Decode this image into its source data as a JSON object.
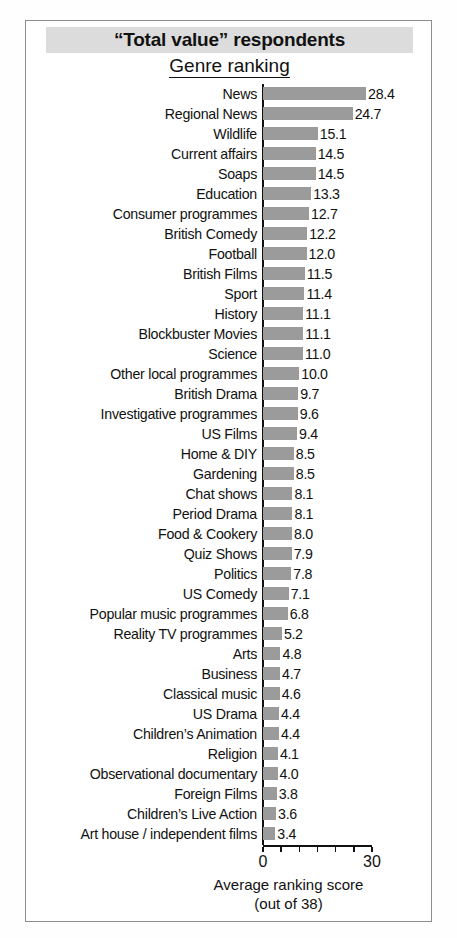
{
  "figure": {
    "title": "“Total value” respondents",
    "subtitle": "Genre ranking",
    "axis_title_line1": "Average ranking score",
    "axis_title_line2": "(out of 38)",
    "tick_label_min": "0",
    "tick_label_max": "30",
    "bar_color": "#9b9b9b",
    "title_band_color": "#dcdcdc",
    "frame_color": "#8d8d8d"
  },
  "chart_data": {
    "type": "bar",
    "orientation": "horizontal",
    "xlabel": "Average ranking score (out of 38)",
    "ylabel": "",
    "xlim": [
      0,
      30
    ],
    "xticks": [
      0,
      5,
      10,
      15,
      20,
      25,
      30
    ],
    "xtick_labels": [
      "0",
      "",
      "",
      "",
      "",
      "",
      "30"
    ],
    "grid": false,
    "legend": null,
    "categories": [
      "News",
      "Regional News",
      "Wildlife",
      "Current affairs",
      "Soaps",
      "Education",
      "Consumer programmes",
      "British Comedy",
      "Football",
      "British Films",
      "Sport",
      "History",
      "Blockbuster Movies",
      "Science",
      "Other local programmes",
      "British Drama",
      "Investigative programmes",
      "US Films",
      "Home & DIY",
      "Gardening",
      "Chat shows",
      "Period Drama",
      "Food & Cookery",
      "Quiz Shows",
      "Politics",
      "US Comedy",
      "Popular music programmes",
      "Reality TV programmes",
      "Arts",
      "Business",
      "Classical music",
      "US Drama",
      "Children’s Animation",
      "Religion",
      "Observational documentary",
      "Foreign Films",
      "Children’s Live Action",
      "Art house / independent films"
    ],
    "values": [
      28.4,
      24.7,
      15.1,
      14.5,
      14.5,
      13.3,
      12.7,
      12.2,
      12.0,
      11.5,
      11.4,
      11.1,
      11.1,
      11.0,
      10.0,
      9.7,
      9.6,
      9.4,
      8.5,
      8.5,
      8.1,
      8.1,
      8.0,
      7.9,
      7.8,
      7.1,
      6.8,
      5.2,
      4.8,
      4.7,
      4.6,
      4.4,
      4.4,
      4.1,
      4.0,
      3.8,
      3.6,
      3.4
    ],
    "value_labels": [
      "28.4",
      "24.7",
      "15.1",
      "14.5",
      "14.5",
      "13.3",
      "12.7",
      "12.2",
      "12.0",
      "11.5",
      "11.4",
      "11.1",
      "11.1",
      "11.0",
      "10.0",
      "9.7",
      "9.6",
      "9.4",
      "8.5",
      "8.5",
      "8.1",
      "8.1",
      "8.0",
      "7.9",
      "7.8",
      "7.1",
      "6.8",
      "5.2",
      "4.8",
      "4.7",
      "4.6",
      "4.4",
      "4.4",
      "4.1",
      "4.0",
      "3.8",
      "3.6",
      "3.4"
    ]
  }
}
